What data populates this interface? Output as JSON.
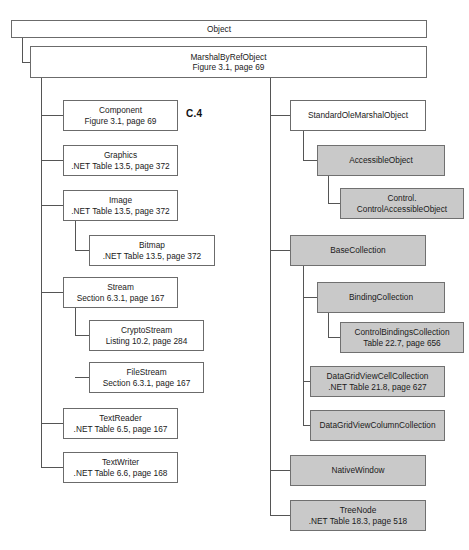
{
  "diagram": {
    "figure_label": "C.4",
    "colors": {
      "shaded_fill": "#c9c9c9",
      "plain_fill": "#ffffff",
      "border": "#6b6b6b",
      "line": "#555555",
      "text": "#1a1a1a"
    },
    "nodes": [
      {
        "id": "object",
        "title": "Object",
        "sub": "",
        "shaded": false,
        "x": 11,
        "y": 20,
        "w": 416,
        "h": 18
      },
      {
        "id": "marshalbyrefobject",
        "title": "MarshalByRefObject",
        "sub": "Figure 3.1, page 69",
        "shaded": false,
        "x": 30,
        "y": 46,
        "w": 397,
        "h": 32
      },
      {
        "id": "component",
        "title": "Component",
        "sub": "Figure 3.1, page 69",
        "shaded": false,
        "x": 63,
        "y": 100,
        "w": 115,
        "h": 31
      },
      {
        "id": "graphics",
        "title": "Graphics",
        "sub": ".NET Table 13.5, page 372",
        "shaded": false,
        "x": 63,
        "y": 145,
        "w": 115,
        "h": 31
      },
      {
        "id": "image",
        "title": "Image",
        "sub": ".NET Table 13.5, page 372",
        "shaded": false,
        "x": 63,
        "y": 190,
        "w": 115,
        "h": 31
      },
      {
        "id": "bitmap",
        "title": "Bitmap",
        "sub": ".NET Table 13.5, page 372",
        "shaded": false,
        "x": 89,
        "y": 235,
        "w": 126,
        "h": 31
      },
      {
        "id": "stream",
        "title": "Stream",
        "sub": "Section 6.3.1, page 167",
        "shaded": false,
        "x": 63,
        "y": 277,
        "w": 115,
        "h": 31
      },
      {
        "id": "cryptostream",
        "title": "CryptoStream",
        "sub": "Listing 10.2, page 284",
        "shaded": false,
        "x": 89,
        "y": 320,
        "w": 115,
        "h": 31
      },
      {
        "id": "filestream",
        "title": "FileStream",
        "sub": "Section 6.3.1, page 167",
        "shaded": false,
        "x": 89,
        "y": 362,
        "w": 115,
        "h": 31
      },
      {
        "id": "textreader",
        "title": "TextReader",
        "sub": ".NET Table 6.5, page 167",
        "shaded": false,
        "x": 63,
        "y": 408,
        "w": 115,
        "h": 31
      },
      {
        "id": "textwriter",
        "title": "TextWriter",
        "sub": ".NET Table 6.6, page 168",
        "shaded": false,
        "x": 63,
        "y": 452,
        "w": 115,
        "h": 31
      },
      {
        "id": "standardolemarshalobject",
        "title": "StandardOleMarshalObject",
        "sub": "",
        "shaded": false,
        "x": 290,
        "y": 100,
        "w": 136,
        "h": 31
      },
      {
        "id": "accessibleobject",
        "title": "AccessibleObject",
        "sub": "",
        "shaded": true,
        "x": 317,
        "y": 145,
        "w": 128,
        "h": 31
      },
      {
        "id": "control-controlaccessibleobject",
        "title": "Control.",
        "sub": "ControlAccessibleObject",
        "shaded": true,
        "x": 340,
        "y": 188,
        "w": 124,
        "h": 31
      },
      {
        "id": "basecollection",
        "title": "BaseCollection",
        "sub": "",
        "shaded": true,
        "x": 290,
        "y": 235,
        "w": 136,
        "h": 31
      },
      {
        "id": "bindingcollection",
        "title": "BindingCollection",
        "sub": "",
        "shaded": true,
        "x": 317,
        "y": 282,
        "w": 128,
        "h": 31
      },
      {
        "id": "controlbindingscollection",
        "title": "ControlBindingsCollection",
        "sub": "Table 22.7, page 656",
        "shaded": true,
        "x": 340,
        "y": 322,
        "w": 124,
        "h": 31
      },
      {
        "id": "datagridviewcellcollection",
        "title": "DataGridViewCellCollection",
        "sub": ".NET Table 21.8, page 627",
        "shaded": true,
        "x": 310,
        "y": 366,
        "w": 135,
        "h": 31
      },
      {
        "id": "datagridviewcolumncollection",
        "title": "DataGridViewColumnCollection",
        "sub": "",
        "shaded": true,
        "x": 310,
        "y": 410,
        "w": 135,
        "h": 31
      },
      {
        "id": "nativewindow",
        "title": "NativeWindow",
        "sub": "",
        "shaded": true,
        "x": 290,
        "y": 455,
        "w": 136,
        "h": 31
      },
      {
        "id": "treenode",
        "title": "TreeNode",
        "sub": ".NET Table 18.3, page 518",
        "shaded": true,
        "x": 290,
        "y": 500,
        "w": 136,
        "h": 31
      }
    ],
    "connectors": [
      {
        "from": "object",
        "to": "marshalbyrefobject",
        "trunk_x": 22,
        "path": "M22,38 L22,62 L30,62"
      },
      {
        "from": "marshalbyrefobject",
        "to": "component",
        "trunk_x": 41,
        "path": "M41,78 L41,115 L63,115"
      },
      {
        "from": "marshalbyrefobject",
        "to": "graphics",
        "trunk_x": 41,
        "path": "M41,160 L63,160"
      },
      {
        "from": "marshalbyrefobject",
        "to": "image",
        "trunk_x": 41,
        "path": "M41,205 L63,205"
      },
      {
        "from": "image",
        "to": "bitmap",
        "trunk_x": 75,
        "path": "M75,221 L75,250 L89,250"
      },
      {
        "from": "marshalbyrefobject",
        "to": "stream",
        "trunk_x": 41,
        "path": "M41,292 L63,292"
      },
      {
        "from": "stream",
        "to": "cryptostream",
        "trunk_x": 75,
        "path": "M75,308 L75,335 L89,335"
      },
      {
        "from": "stream",
        "to": "filestream",
        "trunk_x": 75,
        "path": "M75,377 L89,377"
      },
      {
        "from": "marshalbyrefobject",
        "to": "textreader",
        "trunk_x": 41,
        "path": "M41,423 L63,423"
      },
      {
        "from": "marshalbyrefobject",
        "to": "textwriter",
        "trunk_x": 41,
        "path": "M41,467 L63,467"
      },
      {
        "from": "marshalbyrefobject",
        "to": "left-trunk",
        "trunk_x": 41,
        "path": "M41,78 L41,467"
      },
      {
        "from": "marshalbyrefobject",
        "to": "right-trunk",
        "trunk_x": 270,
        "path": "M270,78 L270,515"
      },
      {
        "from": "marshalbyrefobject",
        "to": "standardolemarshalobject",
        "trunk_x": 270,
        "path": "M270,115 L290,115"
      },
      {
        "from": "standardolemarshalobject",
        "to": "accessibleobject",
        "trunk_x": 303,
        "path": "M303,131 L303,160 L317,160"
      },
      {
        "from": "accessibleobject",
        "to": "control-controlaccessibleobject",
        "trunk_x": 328,
        "path": "M328,176 L328,203 L340,203"
      },
      {
        "from": "marshalbyrefobject",
        "to": "basecollection",
        "trunk_x": 270,
        "path": "M270,250 L290,250"
      },
      {
        "from": "basecollection",
        "to": "bindingcollection",
        "trunk_x": 303,
        "path": "M303,266 L303,297 L317,297"
      },
      {
        "from": "bindingcollection",
        "to": "controlbindingscollection",
        "trunk_x": 328,
        "path": "M328,313 L328,337 L340,337"
      },
      {
        "from": "basecollection",
        "to": "datagridviewcellcollection",
        "trunk_x": 303,
        "path": "M303,381 L310,381"
      },
      {
        "from": "basecollection",
        "to": "datagridviewcolumncollection",
        "trunk_x": 303,
        "path": "M303,425 L310,425"
      },
      {
        "from": "basecollection",
        "to": "collection-trunk",
        "trunk_x": 303,
        "path": "M303,266 L303,425"
      },
      {
        "from": "marshalbyrefobject",
        "to": "nativewindow",
        "trunk_x": 270,
        "path": "M270,470 L290,470"
      },
      {
        "from": "marshalbyrefobject",
        "to": "treenode",
        "trunk_x": 270,
        "path": "M270,515 L290,515"
      }
    ]
  }
}
